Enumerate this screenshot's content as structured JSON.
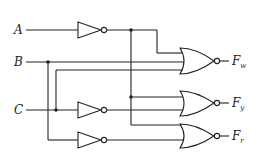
{
  "inputs": [
    {
      "name": "A",
      "y": 30
    },
    {
      "name": "B",
      "y": 62
    },
    {
      "name": "C",
      "y": 110
    }
  ],
  "outputs": [
    {
      "name": "F",
      "sub": "w",
      "y": 61
    },
    {
      "name": "F",
      "sub": "y",
      "y": 103
    },
    {
      "name": "F",
      "sub": "r",
      "y": 136
    }
  ],
  "gates": {
    "inverters": [
      "NOT A",
      "NOT C",
      "NOT B"
    ],
    "nor_gates": [
      "NOR Fw",
      "NOR Fy",
      "NOR Fr"
    ]
  },
  "colors": {
    "stroke": "#222222",
    "background": "#ffffff"
  }
}
